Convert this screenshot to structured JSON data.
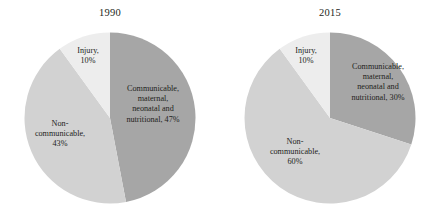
{
  "figure": {
    "background_color": "#ffffff",
    "text_color": "#231f20"
  },
  "panels": [
    {
      "title": "1990",
      "labels": {
        "communicable": "Communicable,\nmaternal,\nneonatal and\nnutritional, 47%",
        "noncommunicable": "Non-\ncommunicable,\n43%",
        "injury": "Injury,\n10%"
      }
    },
    {
      "title": "2015",
      "labels": {
        "communicable": "Communicable,\nmaternal,\nneonatal and\nnutritional, 30%",
        "noncommunicable": "Non-\ncommunicable,\n60%",
        "injury": "Injury,\n10%"
      }
    }
  ],
  "chart_data": [
    {
      "type": "pie",
      "title": "1990",
      "categories": [
        "Communicable, maternal, neonatal and nutritional",
        "Non-communicable",
        "Injury"
      ],
      "values": [
        47,
        43,
        10
      ],
      "value_unit": "%",
      "colors": [
        "#a6a6a6",
        "#d2d2d2",
        "#ededed"
      ],
      "start_angle_deg": 0,
      "direction": "clockwise",
      "legend": "none",
      "labels_inside": true
    },
    {
      "type": "pie",
      "title": "2015",
      "categories": [
        "Communicable, maternal, neonatal and nutritional",
        "Non-communicable",
        "Injury"
      ],
      "values": [
        30,
        60,
        10
      ],
      "value_unit": "%",
      "colors": [
        "#a6a6a6",
        "#d2d2d2",
        "#ededed"
      ],
      "start_angle_deg": 0,
      "direction": "clockwise",
      "legend": "none",
      "labels_inside": true
    }
  ]
}
